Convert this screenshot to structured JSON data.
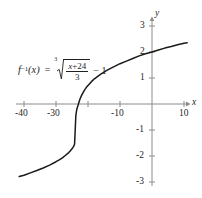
{
  "figure": {
    "title": "",
    "equation": {
      "function_label": "f",
      "inverse_exponent": "−1",
      "argument": "(x)",
      "equals": "=",
      "root_index": "3",
      "numerator_variable": "x",
      "numerator_plus": "+",
      "numerator_constant": "24",
      "denominator": "3",
      "trailing": "− 1",
      "plain_text": "f⁻¹(x) = ∛((x + 24)/3) − 1"
    }
  },
  "chart_data": {
    "type": "line",
    "title": "",
    "xlabel": "x",
    "ylabel": "y",
    "xlim": [
      -42,
      12
    ],
    "ylim": [
      -3.4,
      3.4
    ],
    "grid": false,
    "legend": null,
    "xticks": [
      -40,
      -30,
      -20,
      -10,
      10
    ],
    "xtick_labels": [
      "-40",
      "-30",
      "",
      "-10",
      "10"
    ],
    "yticks": [
      3,
      2,
      1,
      -1,
      -2,
      -3
    ],
    "ytick_labels": [
      "3",
      "2",
      "1",
      "-1",
      "-2",
      "-3"
    ],
    "axis_color": "#8c8c8c",
    "curve_color": "#1a1a1a",
    "series": [
      {
        "name": "f^-1(x) = cbrt((x+24)/3) - 1",
        "x": [
          -41.5,
          -40,
          -38,
          -36,
          -34,
          -32,
          -30,
          -29,
          -28,
          -27,
          -26.5,
          -26,
          -25.5,
          -25,
          -24.8,
          -24.5,
          -24.2,
          -24,
          -23.8,
          -23.5,
          -23.2,
          -23,
          -22.5,
          -22,
          -21.5,
          -21,
          -20.5,
          -20,
          -19,
          -18,
          -16,
          -14,
          -12,
          -10,
          -8,
          -6,
          -4,
          -2,
          0,
          2,
          4,
          6,
          8,
          10,
          11
        ],
        "y": [
          -2.79,
          -2.74,
          -2.65,
          -2.56,
          -2.46,
          -2.35,
          -2.22,
          -2.15,
          -2.07,
          -1.97,
          -1.92,
          -1.87,
          -1.8,
          -1.72,
          -1.69,
          -1.63,
          -1.55,
          -1.0,
          -0.45,
          -0.2,
          -0.09,
          0.0,
          0.19,
          0.33,
          0.45,
          0.55,
          0.64,
          0.71,
          0.85,
          0.97,
          1.15,
          1.3,
          1.43,
          1.55,
          1.65,
          1.75,
          1.85,
          1.93,
          2.0,
          2.08,
          2.15,
          2.21,
          2.28,
          2.34,
          2.36
        ]
      }
    ],
    "annotations": [
      {
        "text": "f^-1(x) = cbrt((x + 24)/3) - 1",
        "x": -40,
        "y": 1.75
      }
    ]
  }
}
